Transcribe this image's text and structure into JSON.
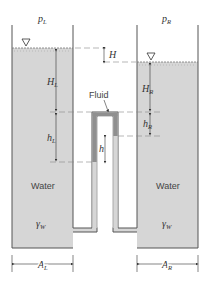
{
  "diagram": {
    "type": "two-tank-manometer",
    "labels": {
      "pressure_left": "p",
      "pressure_left_sub": "L",
      "pressure_right": "p",
      "pressure_right_sub": "R",
      "head_diff": "H",
      "height_left": "H",
      "height_left_sub": "L",
      "height_right": "H",
      "height_right_sub": "R",
      "h_left": "h",
      "h_left_sub": "L",
      "h_right": "h",
      "h_right_sub": "R",
      "h": "h",
      "fluid": "Fluid",
      "water_left": "Water",
      "water_right": "Water",
      "gamma_left": "γ",
      "gamma_left_sub": "W",
      "gamma_right": "γ",
      "gamma_right_sub": "W",
      "area_left": "A",
      "area_left_sub": "L",
      "area_right": "A",
      "area_right_sub": "R"
    },
    "colors": {
      "water": "#d6d6d6",
      "fluid": "#8f8f8f",
      "outline": "#555555",
      "dashed": "#888888",
      "background": "#ffffff"
    }
  }
}
